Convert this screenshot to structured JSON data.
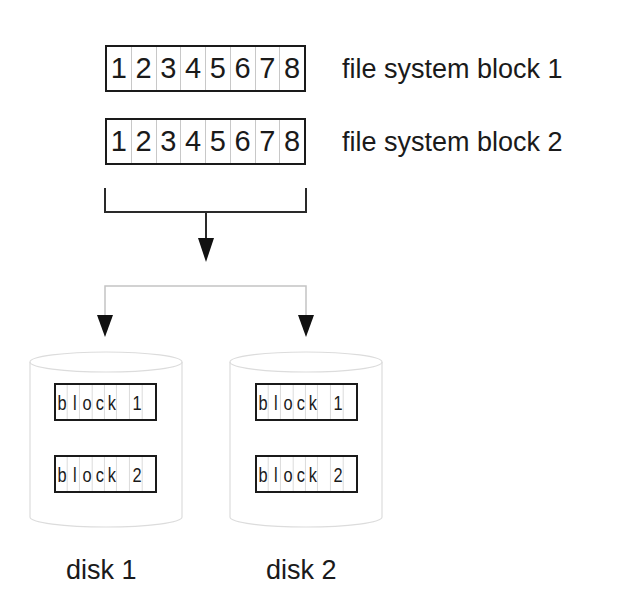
{
  "diagram": {
    "fs_blocks": [
      {
        "label": "file system block 1",
        "cells": [
          "1",
          "2",
          "3",
          "4",
          "5",
          "6",
          "7",
          "8"
        ]
      },
      {
        "label": "file system block 2",
        "cells": [
          "1",
          "2",
          "3",
          "4",
          "5",
          "6",
          "7",
          "8"
        ]
      }
    ],
    "disks": [
      {
        "label": "disk 1",
        "blocks": [
          {
            "cells": [
              "b",
              "l",
              "o",
              "c",
              "k",
              "",
              "1",
              ""
            ]
          },
          {
            "cells": [
              "b",
              "l",
              "o",
              "c",
              "k",
              "",
              "2",
              ""
            ]
          }
        ]
      },
      {
        "label": "disk 2",
        "blocks": [
          {
            "cells": [
              "b",
              "l",
              "o",
              "c",
              "k",
              "",
              "1",
              ""
            ]
          },
          {
            "cells": [
              "b",
              "l",
              "o",
              "c",
              "k",
              "",
              "2",
              ""
            ]
          }
        ]
      }
    ],
    "colors": {
      "ink": "#1a1a1a",
      "cell_divider": "#c8c8c8",
      "branch_line": "#c0c0c0",
      "cylinder_outline": "#dcdcdc"
    }
  }
}
